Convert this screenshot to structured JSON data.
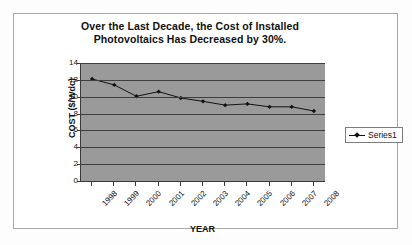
{
  "chart_data": {
    "type": "line",
    "title": "Over the Last Decade, the Cost of Installed Photovoltaics Has Decreased by 30%.",
    "title_line1": "Over the Last Decade, the Cost of Installed",
    "title_line2": "Photovoltaics Has Decreased by 30%.",
    "xlabel": "YEAR",
    "ylabel": "COST ($/Wdc)",
    "categories": [
      "1998",
      "1999",
      "2000",
      "2001",
      "2002",
      "2003",
      "2004",
      "2005",
      "2006",
      "2007",
      "2008"
    ],
    "series": [
      {
        "name": "Series1",
        "values": [
          12.1,
          11.4,
          10.05,
          10.6,
          9.85,
          9.45,
          9.0,
          9.15,
          8.8,
          8.8,
          8.3
        ]
      }
    ],
    "ylim": [
      0,
      14
    ],
    "yticks": [
      14,
      12,
      10,
      8,
      6,
      4,
      2,
      0
    ],
    "grid": "horizontal",
    "legend_position": "right",
    "plot_background_color": "#9a9a9a",
    "series_color": "#111111",
    "axis_color": "#3a3a3a"
  },
  "legend": {
    "entries": [
      {
        "label": "Series1",
        "marker": "diamond-marker-icon"
      }
    ]
  }
}
